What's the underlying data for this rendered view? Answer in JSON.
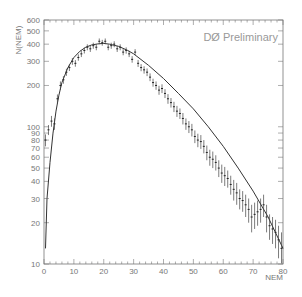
{
  "chart_data": {
    "type": "scatter",
    "title": "DØ Preliminary",
    "xlabel": "NEM",
    "ylabel": "N(NEM)",
    "xlim": [
      0,
      80
    ],
    "ylim": [
      10,
      600
    ],
    "yscale": "log",
    "grid": false,
    "legend": null,
    "x_ticks": [
      0,
      10,
      20,
      30,
      40,
      50,
      60,
      70,
      80
    ],
    "y_ticks": [
      10,
      20,
      30,
      40,
      50,
      60,
      70,
      80,
      90,
      100,
      200,
      300,
      400,
      500,
      600
    ],
    "series": [
      {
        "name": "data",
        "style": "points-with-errorbars",
        "x": [
          0,
          1,
          2,
          3,
          4,
          5,
          6,
          7,
          8,
          9,
          10,
          11,
          12,
          13,
          14,
          15,
          16,
          17,
          18,
          19,
          20,
          21,
          22,
          23,
          24,
          25,
          26,
          27,
          28,
          29,
          30,
          31,
          32,
          33,
          34,
          35,
          36,
          37,
          38,
          39,
          40,
          41,
          42,
          43,
          44,
          45,
          46,
          47,
          48,
          49,
          50,
          51,
          52,
          53,
          54,
          55,
          56,
          57,
          58,
          59,
          60,
          61,
          62,
          63,
          64,
          65,
          66,
          67,
          68,
          69,
          70,
          71,
          72,
          73,
          74,
          75,
          76,
          77,
          78,
          79
        ],
        "y": [
          80,
          95,
          110,
          105,
          160,
          200,
          220,
          250,
          270,
          300,
          290,
          320,
          340,
          360,
          380,
          370,
          390,
          380,
          420,
          410,
          420,
          380,
          390,
          400,
          370,
          380,
          350,
          360,
          340,
          310,
          350,
          290,
          270,
          260,
          250,
          230,
          210,
          200,
          185,
          190,
          175,
          160,
          150,
          140,
          130,
          125,
          115,
          105,
          100,
          95,
          85,
          80,
          78,
          72,
          65,
          60,
          58,
          55,
          50,
          46,
          44,
          42,
          38,
          35,
          33,
          30,
          29,
          27,
          25,
          22,
          23,
          24,
          25,
          27,
          22,
          19,
          18,
          17,
          15,
          13
        ],
        "yerr": [
          8,
          8,
          10,
          10,
          12,
          14,
          14,
          15,
          15,
          17,
          16,
          17,
          18,
          18,
          19,
          19,
          20,
          19,
          20,
          20,
          20,
          19,
          20,
          20,
          19,
          19,
          18,
          19,
          18,
          17,
          18,
          17,
          16,
          16,
          16,
          15,
          14,
          14,
          14,
          14,
          13,
          13,
          12,
          12,
          12,
          11,
          11,
          10,
          10,
          10,
          9,
          9,
          9,
          8,
          8,
          8,
          8,
          7,
          7,
          7,
          7,
          6,
          6,
          6,
          6,
          5,
          5,
          5,
          5,
          5,
          5,
          5,
          5,
          5,
          5,
          4,
          4,
          4,
          4,
          4
        ]
      },
      {
        "name": "fit",
        "style": "line",
        "x": [
          0.5,
          1,
          2,
          3,
          4,
          5,
          6,
          8,
          10,
          12,
          14,
          16,
          18,
          20,
          22,
          25,
          28,
          30,
          35,
          40,
          45,
          50,
          55,
          60,
          65,
          70,
          75,
          80
        ],
        "y": [
          13,
          30,
          55,
          90,
          130,
          170,
          210,
          270,
          320,
          355,
          380,
          395,
          402,
          405,
          400,
          385,
          360,
          340,
          280,
          225,
          175,
          135,
          100,
          72,
          50,
          34,
          22,
          13
        ]
      }
    ]
  },
  "labels": {
    "title": "DØ Preliminary",
    "xlabel": "NEM",
    "ylabel": "N(NEM)",
    "y_tick_labels": [
      "600",
      "500",
      "400",
      "300",
      "200",
      "100",
      "90",
      "80",
      "70",
      "60",
      "50",
      "40",
      "30",
      "20",
      "10"
    ],
    "x_tick_labels": [
      "0",
      "10",
      "20",
      "30",
      "40",
      "50",
      "60",
      "70",
      "80"
    ]
  }
}
